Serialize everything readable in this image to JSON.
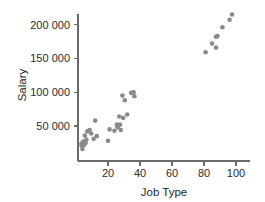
{
  "chart_data": {
    "type": "scatter",
    "title": "",
    "xlabel": "Job Type",
    "ylabel": "Salary",
    "xlim": [
      0,
      104
    ],
    "ylim": [
      0,
      228000
    ],
    "xticks": [
      20,
      40,
      60,
      80,
      100
    ],
    "xticklabels": [
      "20",
      "40",
      "60",
      "80",
      "100"
    ],
    "yticks": [
      50000,
      100000,
      150000,
      200000
    ],
    "yticklabels": [
      "50 000",
      "100 000",
      "150 000",
      "200 000"
    ],
    "grid": false,
    "legend": null,
    "marker": {
      "shape": "circle",
      "color": "#8a8a8a",
      "size": 4.6
    },
    "points": [
      {
        "x": 3.5,
        "y": 24000
      },
      {
        "x": 3.5,
        "y": 21000
      },
      {
        "x": 4.0,
        "y": 16000
      },
      {
        "x": 4.5,
        "y": 27000
      },
      {
        "x": 5.0,
        "y": 22000
      },
      {
        "x": 5.5,
        "y": 36000
      },
      {
        "x": 6.0,
        "y": 25000
      },
      {
        "x": 6.5,
        "y": 30000
      },
      {
        "x": 7.0,
        "y": 42000
      },
      {
        "x": 8.5,
        "y": 44000
      },
      {
        "x": 9.5,
        "y": 39000
      },
      {
        "x": 11.0,
        "y": 31000
      },
      {
        "x": 12.0,
        "y": 58000
      },
      {
        "x": 13.0,
        "y": 35000
      },
      {
        "x": 20.0,
        "y": 28000
      },
      {
        "x": 21.0,
        "y": 45000
      },
      {
        "x": 24.0,
        "y": 43000
      },
      {
        "x": 25.5,
        "y": 52000
      },
      {
        "x": 26.0,
        "y": 48000
      },
      {
        "x": 27.0,
        "y": 64000
      },
      {
        "x": 27.5,
        "y": 52000
      },
      {
        "x": 28.0,
        "y": 44000
      },
      {
        "x": 29.0,
        "y": 95000
      },
      {
        "x": 29.5,
        "y": 62000
      },
      {
        "x": 30.5,
        "y": 88000
      },
      {
        "x": 32.0,
        "y": 67000
      },
      {
        "x": 34.5,
        "y": 99000
      },
      {
        "x": 36.0,
        "y": 100000
      },
      {
        "x": 36.5,
        "y": 94000
      },
      {
        "x": 81.0,
        "y": 159000
      },
      {
        "x": 85.0,
        "y": 172000
      },
      {
        "x": 87.5,
        "y": 166000
      },
      {
        "x": 87.5,
        "y": 182000
      },
      {
        "x": 88.5,
        "y": 183000
      },
      {
        "x": 91.5,
        "y": 196000
      },
      {
        "x": 96.0,
        "y": 207000
      },
      {
        "x": 97.5,
        "y": 215000
      }
    ]
  }
}
